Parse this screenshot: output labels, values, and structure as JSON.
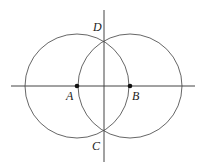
{
  "diagram": {
    "type": "geometric-construction",
    "points": [
      {
        "name": "A",
        "label": "A",
        "x": 77,
        "y": 86,
        "filled": true
      },
      {
        "name": "B",
        "label": "B",
        "x": 130,
        "y": 86,
        "filled": true
      },
      {
        "name": "D",
        "label": "D",
        "x": 104,
        "y": 38,
        "filled": false
      },
      {
        "name": "C",
        "label": "C",
        "x": 104,
        "y": 134,
        "filled": false
      }
    ],
    "circles": [
      {
        "center": "A",
        "cx": 77,
        "cy": 86,
        "r": 52
      },
      {
        "center": "B",
        "cx": 130,
        "cy": 86,
        "r": 52
      }
    ],
    "lines": [
      {
        "name": "horizontal-line-AB",
        "x1": 11,
        "y1": 86,
        "x2": 195,
        "y2": 86
      },
      {
        "name": "vertical-line-DC",
        "x1": 104,
        "y1": 10,
        "x2": 104,
        "y2": 162
      }
    ],
    "labels": {
      "A": "A",
      "B": "B",
      "C": "C",
      "D": "D"
    },
    "colors": {
      "stroke": "#444444",
      "point": "#111111"
    }
  }
}
